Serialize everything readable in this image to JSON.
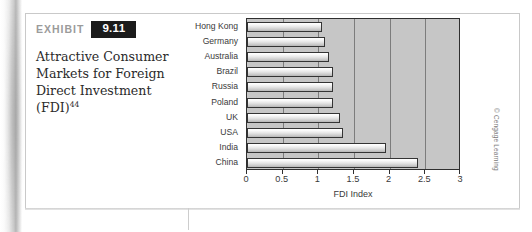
{
  "exhibit": {
    "label": "EXHIBIT",
    "number": "9.11",
    "title_lines": [
      "Attractive Consumer",
      "Markets for Foreign",
      "Direct Investment",
      "(FDI)"
    ],
    "title_footnote": "44"
  },
  "credit": "© Cengage Learning",
  "chart_data": {
    "type": "bar",
    "orientation": "horizontal",
    "title": "",
    "xlabel": "FDI Index",
    "ylabel": "",
    "xlim": [
      0,
      3
    ],
    "xticks": [
      "0",
      "0.5",
      "1",
      "1.5",
      "2",
      "2.5",
      "3"
    ],
    "xtick_values": [
      0,
      0.5,
      1,
      1.5,
      2,
      2.5,
      3
    ],
    "grid": true,
    "grid_axis": "x",
    "legend": "none",
    "categories": [
      "Hong Kong",
      "Germany",
      "Australia",
      "Brazil",
      "Russia",
      "Poland",
      "UK",
      "USA",
      "India",
      "China"
    ],
    "values": [
      1.05,
      1.1,
      1.15,
      1.2,
      1.2,
      1.2,
      1.3,
      1.35,
      1.95,
      2.4
    ],
    "bar_color": "#e0e0e0",
    "bar_edge_color": "#343434",
    "plot_background": "#c6c6c6"
  }
}
